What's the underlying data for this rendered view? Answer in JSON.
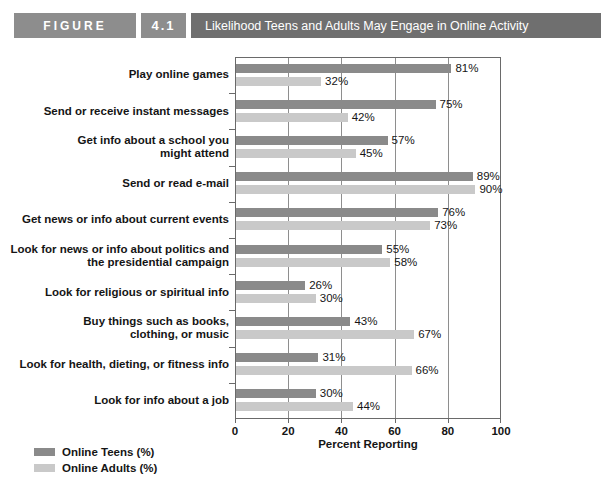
{
  "header": {
    "figure_word": "FIGURE",
    "figure_number": "4.1",
    "title": "Likelihood Teens and Adults May Engage in Online Activity",
    "band_color": "#8d8d8d",
    "title_band_color": "#6f6f6f"
  },
  "chart_data": {
    "type": "bar",
    "orientation": "horizontal",
    "title": "Likelihood Teens and Adults May Engage in Online Activity",
    "xlabel": "Percent Reporting",
    "ylabel": "",
    "xlim": [
      0,
      100
    ],
    "xticks": [
      0,
      20,
      40,
      60,
      80,
      100
    ],
    "xtick_labels": [
      "0",
      "20",
      "40",
      "60",
      "80",
      "100"
    ],
    "grid": true,
    "legend_position": "bottom-left",
    "value_label_suffix": "%",
    "categories": [
      "Play online games",
      "Send or receive instant messages",
      "Get info about a school you might attend",
      "Send or read e-mail",
      "Get news or info about current events",
      "Look for news or info about politics and the presidential campaign",
      "Look for religious or spiritual info",
      "Buy things such as books, clothing, or music",
      "Look for health, dieting, or fitness info",
      "Look for info about a job"
    ],
    "category_lines": [
      [
        "Play online games"
      ],
      [
        "Send or receive instant messages"
      ],
      [
        "Get info about a school you",
        "might attend"
      ],
      [
        "Send or read e-mail"
      ],
      [
        "Get news or info about current events"
      ],
      [
        "Look for news or info about politics and",
        "the presidential campaign"
      ],
      [
        "Look for religious or spiritual info"
      ],
      [
        "Buy things such as books,",
        "clothing, or music"
      ],
      [
        "Look for health, dieting, or fitness info"
      ],
      [
        "Look for info about a job"
      ]
    ],
    "series": [
      {
        "name": "Online Teens (%)",
        "color": "#8a8a8a",
        "values": [
          81,
          75,
          57,
          89,
          76,
          55,
          26,
          43,
          31,
          30
        ],
        "value_labels": [
          "81%",
          "75%",
          "57%",
          "89%",
          "76%",
          "55%",
          "26%",
          "43%",
          "31%",
          "30%"
        ]
      },
      {
        "name": "Online Adults (%)",
        "color": "#c9c9c9",
        "values": [
          32,
          42,
          45,
          90,
          73,
          58,
          30,
          67,
          66,
          44
        ],
        "value_labels": [
          "32%",
          "42%",
          "45%",
          "90%",
          "73%",
          "58%",
          "30%",
          "67%",
          "66%",
          "44%"
        ]
      }
    ]
  },
  "legend": {
    "items": [
      {
        "label": "Online Teens (%)",
        "color": "#8a8a8a"
      },
      {
        "label": "Online Adults (%)",
        "color": "#c9c9c9"
      }
    ]
  }
}
